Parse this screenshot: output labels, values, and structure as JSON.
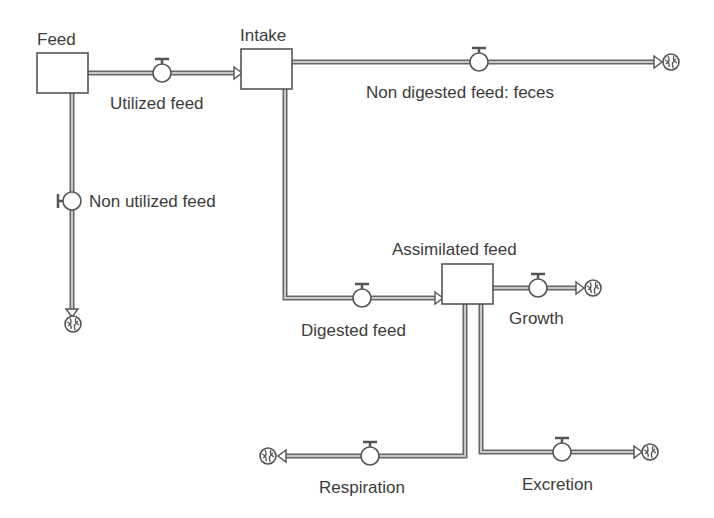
{
  "diagram": {
    "type": "stock-and-flow",
    "colors": {
      "line": "#555555",
      "pipe_fill": "#bdbdbd",
      "text": "#3c3c3c",
      "background": "#ffffff"
    },
    "stocks": [
      {
        "id": "feed",
        "label": "Feed"
      },
      {
        "id": "intake",
        "label": "Intake"
      },
      {
        "id": "assimilated",
        "label": "Assimilated feed"
      }
    ],
    "flows": [
      {
        "id": "utilized",
        "label": "Utilized feed",
        "from": "Feed",
        "to": "Intake"
      },
      {
        "id": "non_utilized",
        "label": "Non utilized feed",
        "from": "Feed",
        "to": "cloud"
      },
      {
        "id": "feces",
        "label": "Non digested feed: feces",
        "from": "Intake",
        "to": "cloud"
      },
      {
        "id": "digested",
        "label": "Digested feed",
        "from": "Intake",
        "to": "Assimilated feed"
      },
      {
        "id": "growth",
        "label": "Growth",
        "from": "Assimilated feed",
        "to": "cloud"
      },
      {
        "id": "respiration",
        "label": "Respiration",
        "from": "Assimilated feed",
        "to": "cloud"
      },
      {
        "id": "excretion",
        "label": "Excretion",
        "from": "Assimilated feed",
        "to": "cloud"
      }
    ]
  }
}
